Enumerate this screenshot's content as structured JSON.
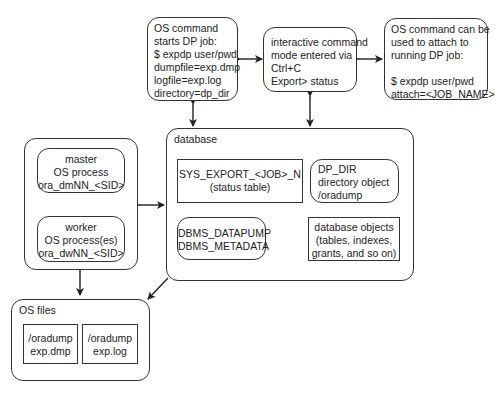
{
  "nodes": {
    "os_cmd_start": {
      "lines": [
        "OS command",
        "starts DP job:",
        "$ expdp user/pwd",
        "dumpfile=exp.dmp",
        "logfile=exp.log",
        "directory=dp_dir"
      ]
    },
    "interactive": {
      "lines": [
        "interactive command",
        "mode entered via",
        "Ctrl+C",
        "Export> status"
      ]
    },
    "os_cmd_attach": {
      "lines": [
        "OS command can be",
        "used to attach to",
        "running DP job:",
        "",
        "$ expdp user/pwd",
        "attach=<JOB_NAME>"
      ]
    },
    "processes": {
      "master": {
        "lines": [
          "master",
          "OS process",
          "ora_dmNN_<SID>"
        ]
      },
      "worker": {
        "lines": [
          "worker",
          "OS process(es)",
          "ora_dwNN_<SID>"
        ]
      }
    },
    "database": {
      "label": "database",
      "status_table": {
        "lines": [
          "SYS_EXPORT_<JOB>_N",
          "(status table)"
        ]
      },
      "dp_dir": {
        "lines": [
          "DP_DIR",
          "directory object",
          "/oradump"
        ]
      },
      "packages": {
        "lines": [
          "DBMS_DATAPUMP",
          "DBMS_METADATA"
        ]
      },
      "db_objects": {
        "lines": [
          "database objects",
          "(tables, indexes,",
          "grants, and so on)"
        ]
      }
    },
    "os_files": {
      "label": "OS files",
      "dmp": {
        "lines": [
          "/oradump",
          "exp.dmp"
        ]
      },
      "log": {
        "lines": [
          "/oradump",
          "exp.log"
        ]
      }
    }
  }
}
